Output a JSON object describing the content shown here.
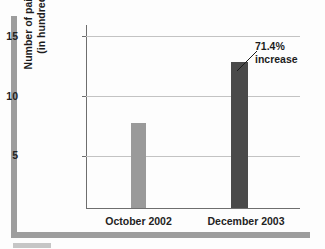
{
  "chart_data": {
    "type": "bar",
    "title": "",
    "subtitle": "",
    "xlabel": "",
    "ylabel_line1": "Number of paid subscriptions",
    "ylabel_line2": "(in hundred thousands)",
    "categories": [
      "October 2002",
      "December 2003"
    ],
    "values": [
      7,
      12
    ],
    "series": [
      {
        "name": "Number of paid subscriptions (in hundred thousands)",
        "values": [
          7,
          12
        ]
      }
    ],
    "bar_colors": [
      "#9a9a9a",
      "#4a4a4a"
    ],
    "ylim": [
      0,
      15
    ],
    "yticks": [
      5,
      10,
      15
    ],
    "ytick_labels": [
      "5",
      "10",
      "15"
    ],
    "grid": true,
    "grid_axis": "y",
    "legend": false,
    "legend_position": "none",
    "annotations": [
      {
        "text_line1": "71.4%",
        "text_line2": "increase",
        "target_category": "December 2003",
        "target_value": 12,
        "leader_line": true
      }
    ]
  },
  "frame": {
    "border_color": "#9d9d9d",
    "tab_color": "#c6c6c6"
  },
  "axes": {
    "axis_color": "#6e6e6e",
    "grid_color": "#c3c3c3",
    "text_color": "#232323"
  }
}
